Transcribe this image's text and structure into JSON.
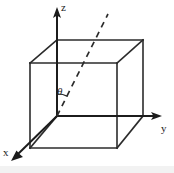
{
  "figure": {
    "background_color": "#ffffff",
    "line_color": "#2b2b2b",
    "axis_color": "#1c1c1c",
    "width": 174,
    "height": 173,
    "labels": {
      "z_axis": "z",
      "y_axis": "y",
      "x_axis": "x",
      "angle": "θ"
    },
    "geometry": {
      "origin": {
        "x": 57,
        "y": 116
      },
      "front_face": [
        {
          "x": 30,
          "y": 63
        },
        {
          "x": 117,
          "y": 63
        },
        {
          "x": 117,
          "y": 148
        },
        {
          "x": 30,
          "y": 148
        }
      ],
      "back_face": [
        {
          "x": 57,
          "y": 40
        },
        {
          "x": 143,
          "y": 40
        },
        {
          "x": 143,
          "y": 116
        },
        {
          "x": 57,
          "y": 116
        }
      ],
      "z_axis_tip": {
        "x": 57,
        "y": 9
      },
      "y_axis_tip": {
        "x": 160,
        "y": 116
      },
      "x_axis_tip": {
        "x": 12,
        "y": 160
      },
      "dashed_ray_end": {
        "x": 108,
        "y": 14
      },
      "angle_arc_radius": 22
    }
  }
}
